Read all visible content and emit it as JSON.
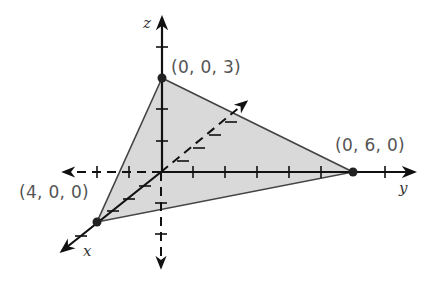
{
  "figure": {
    "axes": {
      "x": {
        "label": "x"
      },
      "y": {
        "label": "y"
      },
      "z": {
        "label": "z"
      }
    },
    "points": [
      {
        "label": "(0, 0, 3)",
        "coords": [
          0,
          0,
          3
        ]
      },
      {
        "label": "(0, 6, 0)",
        "coords": [
          0,
          6,
          0
        ]
      },
      {
        "label": "(4, 0, 0)",
        "coords": [
          4,
          0,
          0
        ]
      }
    ],
    "colors": {
      "fill": "#d9d9d9",
      "edge": "#444444",
      "axis": "#111111",
      "point": "#222222"
    }
  }
}
